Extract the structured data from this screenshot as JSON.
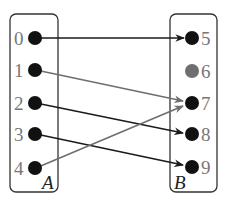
{
  "diagram": {
    "type": "mapping",
    "sets": [
      {
        "name": "A",
        "elements": [
          "0",
          "1",
          "2",
          "3",
          "4"
        ]
      },
      {
        "name": "B",
        "elements": [
          "5",
          "6",
          "7",
          "8",
          "9"
        ]
      }
    ],
    "mappings": [
      {
        "from": "0",
        "to": "5",
        "color": "#1a1a1a"
      },
      {
        "from": "1",
        "to": "7",
        "color": "#6e6e6e"
      },
      {
        "from": "2",
        "to": "8",
        "color": "#1a1a1a"
      },
      {
        "from": "3",
        "to": "9",
        "color": "#1a1a1a"
      },
      {
        "from": "4",
        "to": "7",
        "color": "#6e6e6e"
      }
    ],
    "highlighted_unmapped": {
      "element": "6",
      "color": "#6e6e6e"
    },
    "colors": {
      "dot": "#111111",
      "dot_unmapped": "#6e6e6e",
      "box_border": "#333333",
      "label": "#777777"
    }
  }
}
